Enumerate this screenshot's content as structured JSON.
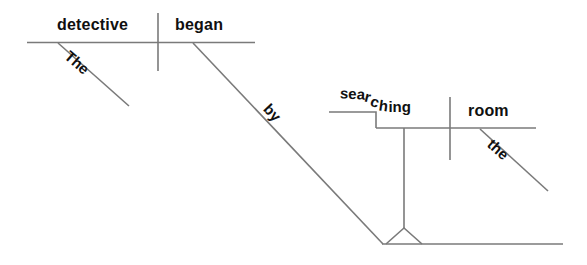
{
  "diagram": {
    "type": "reed-kellogg-sentence-diagram",
    "sentence": "The detective began by searching the room.",
    "line_color": "#7a7a7a",
    "text_color": "#101010",
    "background": "#ffffff",
    "words": {
      "subject": "detective",
      "verb": "began",
      "article_subject": "The",
      "preposition": "by",
      "gerund": "searching",
      "gerund_parts": [
        "sea",
        "r",
        "c",
        "h",
        "ing"
      ],
      "object": "room",
      "article_object": "the"
    }
  }
}
